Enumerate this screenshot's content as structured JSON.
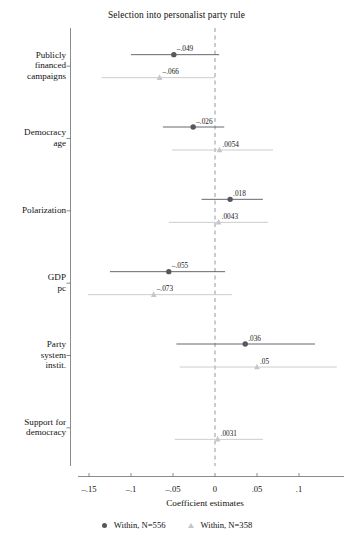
{
  "chart_data": {
    "type": "scatter",
    "title": "Selection into personalist party rule",
    "xlabel": "Coefficient estimates",
    "ylabel": "",
    "xlim": [
      -0.175,
      0.115
    ],
    "xticks": [
      -0.15,
      -0.1,
      -0.05,
      0,
      0.05,
      0.1
    ],
    "xticklabels": [
      "–.15",
      "–.1",
      "–.05",
      "0",
      ".05",
      ".1"
    ],
    "grid": false,
    "zero_reference_line": 0,
    "legend_position": "bottom",
    "categories": [
      "Publicly financed campaigns",
      "Democracy age",
      "Polarization",
      "GDP pc",
      "Party system instit.",
      "Support for democracy"
    ],
    "category_lines": [
      [
        "Publicly",
        "financed",
        "campaigns"
      ],
      [
        "Democracy",
        "age"
      ],
      [
        "Polarization"
      ],
      [
        "GDP",
        "pc"
      ],
      [
        "Party",
        "system",
        "instit."
      ],
      [
        "Support for",
        "democracy"
      ]
    ],
    "series": [
      {
        "name": "Within, N=556",
        "marker": "circle",
        "color": "#58585c",
        "values": [
          -0.049,
          -0.026,
          0.018,
          -0.055,
          0.036,
          null
        ],
        "value_labels": [
          "–.049",
          "–.026",
          ".018",
          "–.055",
          ".036",
          ""
        ],
        "ci_low": [
          -0.1,
          -0.062,
          -0.016,
          -0.125,
          -0.046,
          null
        ],
        "ci_high": [
          0.005,
          0.011,
          0.057,
          0.012,
          0.119,
          null
        ]
      },
      {
        "name": "Within, N=358",
        "marker": "triangle",
        "color": "#c6c6ca",
        "values": [
          -0.066,
          0.0054,
          0.0043,
          -0.073,
          0.05,
          0.0031
        ],
        "value_labels": [
          "–.066",
          ".0054",
          ".0043",
          "–.073",
          ".05",
          ".0031"
        ],
        "ci_low": [
          -0.135,
          -0.051,
          -0.055,
          -0.151,
          -0.042,
          -0.048
        ],
        "ci_high": [
          0.0,
          0.069,
          0.063,
          0.02,
          0.145,
          0.057
        ]
      }
    ]
  },
  "legend": {
    "items": [
      {
        "label": "Within, N=556",
        "marker": "circle"
      },
      {
        "label": "Within, N=358",
        "marker": "triangle"
      }
    ]
  },
  "colors": {
    "series_dark": "#58585c",
    "series_light": "#c6c6ca",
    "axis": "#5a5a5a",
    "zero_line": "#8d8d92"
  }
}
